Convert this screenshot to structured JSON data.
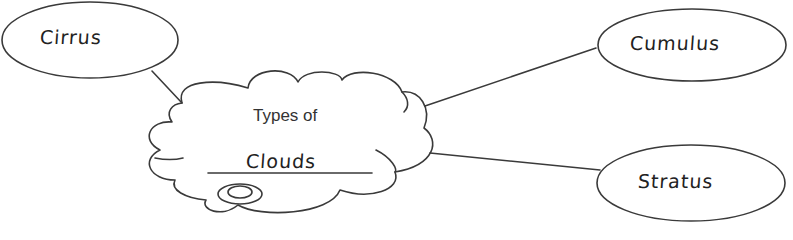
{
  "diagram": {
    "center": {
      "shape": "cloud",
      "prompt": "Types of",
      "answer": "Clouds"
    },
    "nodes": [
      {
        "id": "cirrus",
        "label": "Cirrus",
        "shape": "ellipse",
        "position": "top-left"
      },
      {
        "id": "cumulus",
        "label": "Cumulus",
        "shape": "ellipse",
        "position": "top-right"
      },
      {
        "id": "stratus",
        "label": "Stratus",
        "shape": "ellipse",
        "position": "bottom-right"
      }
    ],
    "edges": [
      {
        "from": "center",
        "to": "cirrus"
      },
      {
        "from": "center",
        "to": "cumulus"
      },
      {
        "from": "center",
        "to": "stratus"
      }
    ],
    "colors": {
      "stroke": "#3a3a3a",
      "text": "#222222",
      "background": "#ffffff"
    }
  }
}
